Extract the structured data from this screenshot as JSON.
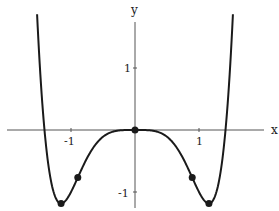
{
  "chart_data": {
    "type": "line",
    "title": "",
    "xlabel": "x",
    "ylabel": "y",
    "function": "y = x^6 - 2x^4",
    "xlim": [
      -2.1,
      2.0
    ],
    "ylim": [
      -1.25,
      1.75
    ],
    "x_ticks": [
      {
        "value": -1,
        "label": "-1"
      },
      {
        "value": 1,
        "label": "1"
      }
    ],
    "y_ticks": [
      {
        "value": 1,
        "label": "1"
      },
      {
        "value": -1,
        "label": "-1"
      }
    ],
    "grid": false,
    "legend": null,
    "series": [
      {
        "name": "curve",
        "x": [
          -1.53,
          -1.5,
          -1.414,
          -1.3,
          -1.155,
          -1.0,
          -0.894,
          -0.7,
          -0.5,
          -0.3,
          0.0,
          0.3,
          0.5,
          0.7,
          0.894,
          1.0,
          1.155,
          1.3,
          1.414,
          1.5,
          1.53
        ],
        "values": [
          1.81,
          1.27,
          0.0,
          -0.89,
          -1.185,
          -1.0,
          -0.768,
          -0.36,
          -0.11,
          -0.016,
          0.0,
          -0.016,
          -0.11,
          -0.36,
          -0.768,
          -1.0,
          -1.185,
          -0.89,
          0.0,
          1.27,
          1.81
        ]
      }
    ],
    "marked_points": [
      {
        "label": "local min left",
        "x": -1.155,
        "y": -1.185
      },
      {
        "label": "inflection left",
        "x": -0.894,
        "y": -0.768
      },
      {
        "label": "origin",
        "x": 0.0,
        "y": 0.0
      },
      {
        "label": "inflection right",
        "x": 0.894,
        "y": -0.768
      },
      {
        "label": "local min right",
        "x": 1.155,
        "y": -1.185
      }
    ]
  },
  "axes": {
    "x_label": "x",
    "y_label": "y",
    "x_tick_neg1": "-1",
    "x_tick_pos1": "1",
    "y_tick_pos1": "1",
    "y_tick_neg1": "-1"
  },
  "colors": {
    "curve": "#1a1a1a",
    "axis": "#555555",
    "background": "#ffffff"
  }
}
